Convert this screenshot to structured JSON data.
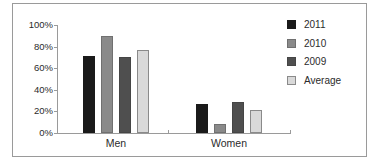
{
  "chart_data": {
    "type": "bar",
    "categories": [
      "Men",
      "Women"
    ],
    "series": [
      {
        "name": "2011",
        "values": [
          71,
          27
        ],
        "color": "#1a1a1a",
        "border": "#1a1a1a"
      },
      {
        "name": "2010",
        "values": [
          90,
          8
        ],
        "color": "#8a8a8a",
        "border": "#707070"
      },
      {
        "name": "2009",
        "values": [
          70,
          29
        ],
        "color": "#4f4f4f",
        "border": "#454545"
      },
      {
        "name": "Average",
        "values": [
          77,
          21
        ],
        "color": "#d9d9d9",
        "border": "#8a8a8a"
      }
    ],
    "title": "",
    "xlabel": "",
    "ylabel": "",
    "ylim": [
      0,
      100
    ],
    "ytick_labels": [
      "0%",
      "20%",
      "40%",
      "60%",
      "80%",
      "100%"
    ],
    "ytick_values": [
      0,
      20,
      40,
      60,
      80,
      100
    ],
    "grid": false,
    "legend_position": "right"
  },
  "colors": {
    "axis": "#9a9a9a",
    "frame": "#9a9a9a",
    "text": "#2b2b2b",
    "background": "#ffffff"
  }
}
